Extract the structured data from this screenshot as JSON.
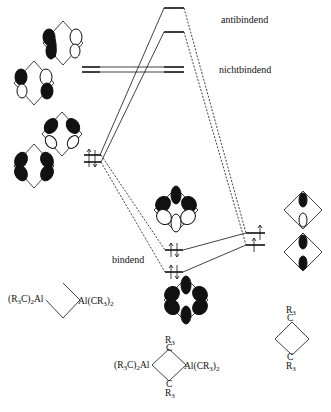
{
  "diagram": {
    "type": "molecular-orbital-diagram",
    "labels": {
      "antibonding": "antibindend",
      "nonbonding": "nichtbindend",
      "bonding": "bindend"
    },
    "fragments": {
      "left": {
        "formula_left": "(R3C)2Al",
        "formula_right": "Al(CR3)2",
        "left_prefix": "(R",
        "left_sub1": "3",
        "left_mid": "C)",
        "left_sub2": "2",
        "left_suffix": "Al",
        "right_prefix": "Al(CR",
        "right_sub1": "3",
        "right_mid": ")",
        "right_sub2": "2"
      },
      "center": {
        "top_group": "R3",
        "top_atom": "C",
        "bottom_atom": "C",
        "bottom_group": "R3",
        "r": "R",
        "sub3": "3",
        "left_prefix": "(R",
        "left_sub1": "3",
        "left_mid": "C)",
        "left_sub2": "2",
        "left_suffix": "Al",
        "right_prefix": "Al(CR",
        "right_sub1": "3",
        "right_mid": ")",
        "right_sub2": "2"
      },
      "right": {
        "top_group": "R3",
        "top_atom": "C",
        "bottom_atom": "C",
        "bottom_group": "R3",
        "r": "R",
        "sub3": "3"
      }
    },
    "levels": {
      "center_antibonding": [
        8,
        32
      ],
      "center_nonbonding": [
        67,
        72
      ],
      "center_bonding": [
        250,
        272
      ],
      "left_nonbonding": [
        67,
        72
      ],
      "left_bonding": [
        155,
        162
      ],
      "right_bonding": [
        233,
        245
      ]
    },
    "caption": "Abb. — MO-Schema (teilweise abgeschnitten)"
  }
}
